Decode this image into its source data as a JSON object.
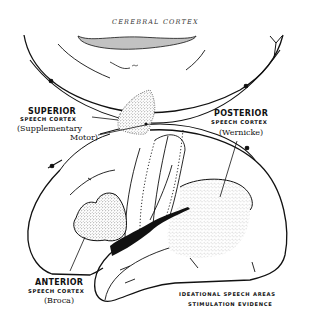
{
  "title": "CEREBRAL CORTEX",
  "labels": {
    "superior": {
      "heading": "SUPERIOR",
      "subheading": "SPEECH CORTEX",
      "name_line1": "(Supplementary",
      "name_line2": "Motor)"
    },
    "posterior": {
      "heading": "POSTERIOR",
      "subheading": "SPEECH CORTEX",
      "name": "(Wernicke)"
    },
    "anterior": {
      "heading": "ANTERIOR",
      "subheading": "SPEECH CORTEX",
      "name": "(Broca)"
    }
  },
  "caption": {
    "line1": "IDEATIONAL SPEECH AREAS",
    "line2": "STIMULATION EVIDENCE"
  },
  "annotation_small": "Cal.",
  "colors": {
    "ink": "#111111",
    "background": "#ffffff",
    "stipple": "#555555"
  }
}
